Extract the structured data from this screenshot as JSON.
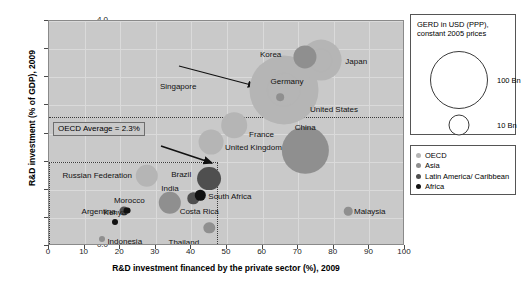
{
  "chart_data": {
    "type": "scatter",
    "title": "",
    "xlabel": "R&D investment financed by the private sector (%), 2009",
    "ylabel": "R&D investment (% of GDP), 2009",
    "xlim": [
      0,
      100
    ],
    "ylim": [
      0.0,
      4.0
    ],
    "xticks": [
      "0",
      "10",
      "20",
      "30",
      "40",
      "50",
      "60",
      "70",
      "80",
      "90",
      "100"
    ],
    "yticks": [
      "0.0",
      "0.5",
      "1.0",
      "1.5",
      "2.0",
      "2.5",
      "3.0",
      "3.5",
      "4.0"
    ],
    "grid": true,
    "size_encoding": "GERD in USD (PPP), constant 2005 prices",
    "points": [
      {
        "label": "Korea",
        "x": 72.0,
        "y": 3.36,
        "size": 45,
        "group": "Asia",
        "label_pos": "r",
        "label_dx": -24,
        "label_dy": -2
      },
      {
        "label": "Japan",
        "x": 76.5,
        "y": 3.3,
        "size": 140,
        "group": "OECD",
        "label_pos": "l",
        "label_dx": 24,
        "label_dy": 2
      },
      {
        "label": "Germany",
        "x": 66.0,
        "y": 2.78,
        "size": 85,
        "group": "OECD",
        "label_pos": "c",
        "label_dx": 3,
        "label_dy": -8
      },
      {
        "label": "Singapore",
        "x": 65.0,
        "y": 2.65,
        "size": 5,
        "group": "Asia",
        "label_pos": "r",
        "label_dx": -84,
        "label_dy": -10
      },
      {
        "label": "United States",
        "x": 66.0,
        "y": 2.78,
        "size": 400,
        "group": "OECD",
        "label_pos": "l",
        "label_dx": 26,
        "label_dy": 20
      },
      {
        "label": "France",
        "x": 52.0,
        "y": 2.15,
        "size": 55,
        "group": "OECD",
        "label_pos": "l",
        "label_dx": 15,
        "label_dy": 10
      },
      {
        "label": "United Kingdom",
        "x": 45.5,
        "y": 1.85,
        "size": 52,
        "group": "OECD",
        "label_pos": "l",
        "label_dx": 14,
        "label_dy": 6
      },
      {
        "label": "China",
        "x": 72.0,
        "y": 1.7,
        "size": 180,
        "group": "Asia",
        "label_pos": "c",
        "label_dx": 0,
        "label_dy": -22
      },
      {
        "label": "Russian Federation",
        "x": 27.5,
        "y": 1.25,
        "size": 42,
        "group": "OECD",
        "label_pos": "r",
        "label_dx": -15,
        "label_dy": 0
      },
      {
        "label": "Brazil",
        "x": 45.0,
        "y": 1.2,
        "size": 48,
        "group": "Latin America/ Caribbean",
        "label_pos": "r",
        "label_dx": -18,
        "label_dy": -4
      },
      {
        "label": "India",
        "x": 34.0,
        "y": 0.77,
        "size": 42,
        "group": "Asia",
        "label_pos": "c",
        "label_dx": 0,
        "label_dy": -14
      },
      {
        "label": "South Africa",
        "x": 42.5,
        "y": 0.9,
        "size": 9,
        "group": "Africa",
        "label_pos": "l",
        "label_dx": 8,
        "label_dy": 2
      },
      {
        "label": "Costa Rica",
        "x": 40.5,
        "y": 0.85,
        "size": 11,
        "group": "Latin America/ Caribbean",
        "label_pos": "c",
        "label_dx": 6,
        "label_dy": 14
      },
      {
        "label": "Morocco",
        "x": 22.0,
        "y": 0.63,
        "size": 4,
        "group": "Africa",
        "label_pos": "c",
        "label_dx": 2,
        "label_dy": -10
      },
      {
        "label": "Argentina",
        "x": 21.0,
        "y": 0.62,
        "size": 7,
        "group": "Latin America/ Caribbean",
        "label_pos": "r",
        "label_dx": -8,
        "label_dy": 1
      },
      {
        "label": "Kenya",
        "x": 18.5,
        "y": 0.42,
        "size": 3,
        "group": "Africa",
        "label_pos": "c",
        "label_dx": 0,
        "label_dy": -9
      },
      {
        "label": "Indonesia",
        "x": 15.0,
        "y": 0.12,
        "size": 3,
        "group": "Asia",
        "label_pos": "l",
        "label_dx": 5,
        "label_dy": 3
      },
      {
        "label": "Thailand",
        "x": 45.0,
        "y": 0.32,
        "size": 11,
        "group": "Asia",
        "label_pos": "r",
        "label_dx": -10,
        "label_dy": 15
      },
      {
        "label": "Malaysia",
        "x": 84.0,
        "y": 0.62,
        "size": 6,
        "group": "Asia",
        "label_pos": "l",
        "label_dx": 6,
        "label_dy": 1
      }
    ],
    "annotations": {
      "oecd_average_label": "OECD Average = 2.3%",
      "oecd_average_value": 2.3,
      "emerging_box": {
        "x0": 0,
        "x1": 47.5,
        "y0": 0.0,
        "y1": 1.5
      }
    }
  },
  "size_legend": {
    "title_line1": "GERD in USD (PPP),",
    "title_line2": "constant 2005 prices",
    "items": [
      {
        "label": "100 Bn",
        "diameter": 56
      },
      {
        "label": "10 Bn",
        "diameter": 19
      },
      {
        "label": "1 Bn",
        "diameter": 6
      }
    ]
  },
  "color_legend": {
    "items": [
      {
        "label": "OECD",
        "color": "#b5b5b5"
      },
      {
        "label": "Asia",
        "color": "#8f8f8f"
      },
      {
        "label": "Latin America/ Caribbean",
        "color": "#4f4f4f"
      },
      {
        "label": "Africa",
        "color": "#111111"
      }
    ]
  }
}
